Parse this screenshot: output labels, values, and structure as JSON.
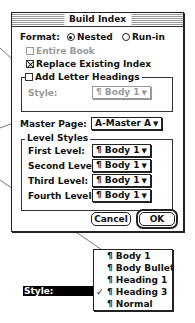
{
  "dialog": {
    "title": "Build Index",
    "format": {
      "label": "Format:",
      "options": [
        {
          "label": "Nested",
          "selected": true
        },
        {
          "label": "Run-in",
          "selected": false
        }
      ]
    },
    "entire_book": {
      "label": "Entire Book",
      "checked": false,
      "enabled": false
    },
    "replace_existing": {
      "label": "Replace Existing Index",
      "checked": true
    },
    "add_letter_headings": {
      "label": "Add Letter Headings",
      "checked": false
    },
    "heading_style": {
      "label": "Style:",
      "value": "¶ Body 1",
      "enabled": false
    },
    "master_page": {
      "label": "Master Page:",
      "value": "A-Master A"
    },
    "level_styles": {
      "title": "Level Styles",
      "levels": [
        {
          "label": "First Level:",
          "value": "¶ Body 1"
        },
        {
          "label": "Second Level:",
          "value": "¶ Body 1"
        },
        {
          "label": "Third Level:",
          "value": "¶ Body 1"
        },
        {
          "label": "Fourth Level:",
          "value": "¶ Body 1"
        }
      ]
    },
    "buttons": {
      "cancel": "Cancel",
      "ok": "OK"
    }
  },
  "callout": {
    "label": "Style:",
    "menu": [
      {
        "label": "¶ Body 1",
        "checked": false
      },
      {
        "label": "¶ Body Bullet",
        "checked": false
      },
      {
        "label": "¶ Heading 1",
        "checked": false
      },
      {
        "label": "¶ Heading 3",
        "checked": true
      },
      {
        "label": "¶ Normal",
        "checked": false
      }
    ],
    "check_mark": "✓",
    "arrow": "▼"
  }
}
